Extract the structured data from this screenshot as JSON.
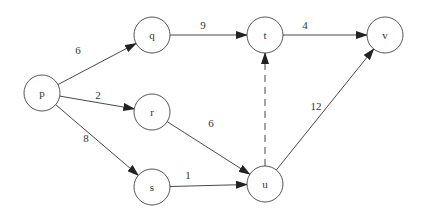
{
  "diagram": {
    "type": "directed-weighted-graph",
    "nodes": [
      {
        "id": "p",
        "label": "p",
        "x": 42,
        "y": 93
      },
      {
        "id": "q",
        "label": "q",
        "x": 152,
        "y": 35
      },
      {
        "id": "r",
        "label": "r",
        "x": 152,
        "y": 112
      },
      {
        "id": "s",
        "label": "s",
        "x": 152,
        "y": 187
      },
      {
        "id": "t",
        "label": "t",
        "x": 265,
        "y": 35
      },
      {
        "id": "u",
        "label": "u",
        "x": 265,
        "y": 184
      },
      {
        "id": "v",
        "label": "v",
        "x": 385,
        "y": 35
      }
    ],
    "edges": [
      {
        "from": "p",
        "to": "q",
        "weight": "6",
        "style": "solid",
        "label_x": 78,
        "label_y": 50
      },
      {
        "from": "p",
        "to": "r",
        "weight": "2",
        "style": "solid",
        "label_x": 98,
        "label_y": 95
      },
      {
        "from": "p",
        "to": "s",
        "weight": "8",
        "style": "solid",
        "label_x": 86,
        "label_y": 138
      },
      {
        "from": "q",
        "to": "t",
        "weight": "9",
        "style": "solid",
        "label_x": 203,
        "label_y": 25
      },
      {
        "from": "t",
        "to": "v",
        "weight": "4",
        "style": "solid",
        "label_x": 305,
        "label_y": 25
      },
      {
        "from": "r",
        "to": "u",
        "weight": "6",
        "style": "solid",
        "label_x": 211,
        "label_y": 123
      },
      {
        "from": "s",
        "to": "u",
        "weight": "1",
        "style": "solid",
        "label_x": 188,
        "label_y": 175
      },
      {
        "from": "u",
        "to": "v",
        "weight": "12",
        "style": "solid",
        "label_x": 316,
        "label_y": 106
      },
      {
        "from": "u",
        "to": "t",
        "weight": "",
        "style": "dashed",
        "label_x": null,
        "label_y": null
      }
    ],
    "node_radius": 18,
    "colors": {
      "stroke": "#444444",
      "text": "#333333",
      "background": "#ffffff"
    }
  }
}
